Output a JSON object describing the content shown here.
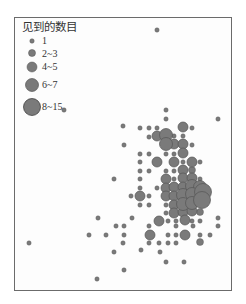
{
  "chart_data": {
    "type": "scatter",
    "title": "",
    "xlabel": "",
    "ylabel": "",
    "grid": false,
    "legend": {
      "title": "见到的数目",
      "position": "top-left",
      "entries": [
        {
          "label": "1",
          "r": 2.2
        },
        {
          "label": "2~3",
          "r": 3.5
        },
        {
          "label": "4~5",
          "r": 5
        },
        {
          "label": "6~7",
          "r": 6.5
        },
        {
          "label": "8~15",
          "r": 8.5
        }
      ]
    },
    "size_scale": {
      "1": 2.2,
      "2": 3.5,
      "3": 5,
      "4": 6.5,
      "5": 8.5
    },
    "point_color": "#7a7a7a",
    "point_stroke": "#555555",
    "points": [
      [
        157,
        30,
        1
      ],
      [
        64,
        110,
        1
      ],
      [
        123,
        126,
        1
      ],
      [
        166,
        110,
        1
      ],
      [
        166,
        119,
        1
      ],
      [
        218,
        119,
        1
      ],
      [
        140,
        128,
        1
      ],
      [
        149,
        128,
        1
      ],
      [
        157,
        128,
        1
      ],
      [
        183,
        127,
        3
      ],
      [
        192,
        128,
        1
      ],
      [
        149,
        137,
        1
      ],
      [
        157,
        136,
        3
      ],
      [
        166,
        135,
        4
      ],
      [
        174,
        136,
        1
      ],
      [
        183,
        136,
        1
      ],
      [
        124,
        145,
        1
      ],
      [
        166,
        144,
        4
      ],
      [
        174,
        144,
        3
      ],
      [
        183,
        144,
        3
      ],
      [
        192,
        145,
        1
      ],
      [
        140,
        154,
        1
      ],
      [
        149,
        154,
        1
      ],
      [
        166,
        154,
        1
      ],
      [
        174,
        154,
        1
      ],
      [
        183,
        153,
        3
      ],
      [
        140,
        162,
        1
      ],
      [
        157,
        162,
        3
      ],
      [
        174,
        162,
        3
      ],
      [
        183,
        162,
        1
      ],
      [
        192,
        162,
        3
      ],
      [
        200,
        162,
        1
      ],
      [
        140,
        171,
        1
      ],
      [
        149,
        171,
        1
      ],
      [
        166,
        171,
        1
      ],
      [
        174,
        171,
        1
      ],
      [
        183,
        170,
        3
      ],
      [
        192,
        170,
        2
      ],
      [
        114,
        179,
        1
      ],
      [
        140,
        179,
        1
      ],
      [
        166,
        179,
        3
      ],
      [
        174,
        179,
        1
      ],
      [
        183,
        178,
        3
      ],
      [
        192,
        178,
        3
      ],
      [
        200,
        179,
        1
      ],
      [
        140,
        188,
        1
      ],
      [
        157,
        188,
        1
      ],
      [
        166,
        188,
        3
      ],
      [
        174,
        187,
        3
      ],
      [
        183,
        187,
        3
      ],
      [
        192,
        186,
        4
      ],
      [
        200,
        187,
        4
      ],
      [
        131,
        196,
        1
      ],
      [
        140,
        196,
        3
      ],
      [
        149,
        196,
        1
      ],
      [
        166,
        196,
        3
      ],
      [
        174,
        196,
        3
      ],
      [
        183,
        195,
        4
      ],
      [
        192,
        194,
        4
      ],
      [
        203,
        192,
        5
      ],
      [
        140,
        205,
        1
      ],
      [
        149,
        205,
        1
      ],
      [
        166,
        205,
        1
      ],
      [
        174,
        205,
        3
      ],
      [
        183,
        204,
        4
      ],
      [
        192,
        203,
        4
      ],
      [
        202,
        200,
        5
      ],
      [
        166,
        213,
        1
      ],
      [
        174,
        213,
        3
      ],
      [
        183,
        212,
        3
      ],
      [
        192,
        211,
        3
      ],
      [
        200,
        212,
        2
      ],
      [
        98,
        218,
        1
      ],
      [
        132,
        218,
        1
      ],
      [
        159,
        221,
        3
      ],
      [
        168,
        221,
        1
      ],
      [
        176,
        221,
        1
      ],
      [
        185,
        220,
        3
      ],
      [
        192,
        221,
        1
      ],
      [
        200,
        221,
        1
      ],
      [
        218,
        218,
        1
      ],
      [
        116,
        226,
        1
      ],
      [
        124,
        226,
        1
      ],
      [
        149,
        226,
        1
      ],
      [
        176,
        226,
        1
      ],
      [
        193,
        226,
        1
      ],
      [
        218,
        226,
        1
      ],
      [
        89,
        235,
        1
      ],
      [
        106,
        235,
        1
      ],
      [
        124,
        235,
        1
      ],
      [
        150,
        235,
        3
      ],
      [
        168,
        235,
        1
      ],
      [
        176,
        235,
        1
      ],
      [
        185,
        235,
        3
      ],
      [
        200,
        235,
        1
      ],
      [
        210,
        235,
        1
      ],
      [
        123,
        243,
        1
      ],
      [
        149,
        243,
        1
      ],
      [
        159,
        243,
        1
      ],
      [
        168,
        243,
        1
      ],
      [
        176,
        243,
        1
      ],
      [
        200,
        242,
        2
      ],
      [
        114,
        252,
        1
      ],
      [
        141,
        250,
        1
      ],
      [
        29,
        243,
        1
      ],
      [
        97,
        279,
        1
      ],
      [
        184,
        262,
        1
      ],
      [
        124,
        270,
        1
      ],
      [
        160,
        252,
        1
      ],
      [
        166,
        262,
        1
      ]
    ]
  }
}
